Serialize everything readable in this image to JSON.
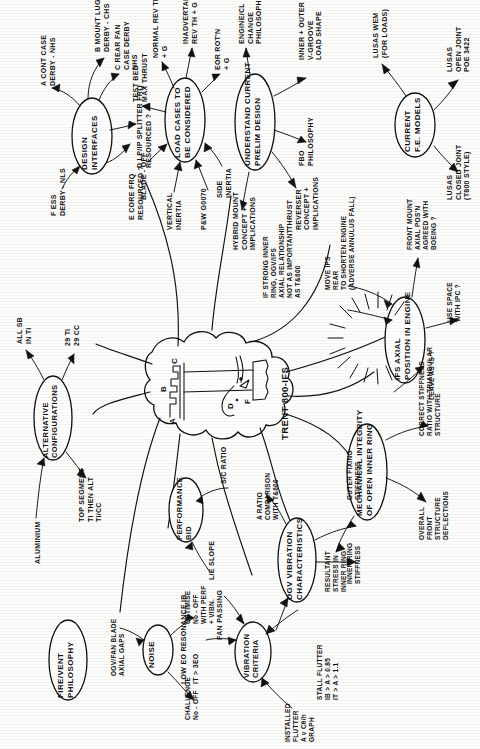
{
  "document": {
    "title": "TRENT 800-IFS Design Mind Map",
    "medium": "hand-drawn pencil sketch, scanned",
    "orientation": "text rotated 90 degrees (reads bottom-to-top)",
    "center_label": "TRENT 800-IFS",
    "center_sketch_labels": [
      "A",
      "B",
      "C",
      "D",
      "F"
    ]
  },
  "nodes": [
    {
      "id": "design-interfaces",
      "label": "DESIGN\nINTERFACES",
      "branches": [
        "A CONT CASE\nDERBY - NHS",
        "B MOUNT LUGS\nDERBY - CHS",
        "C REAR FAN\nCASE DERBY\nNHS",
        "D LP/IP SPLITTER FRQ\nRESOURCED ?",
        "E CORE FRQ\nRESOURCED ?",
        "F ESS\nDERBY - NLS"
      ]
    },
    {
      "id": "load-cases",
      "label": "LOAD CASES TO\nBE CONSIDERED",
      "branches": [
        "NORMAL REV TH\n+ G",
        "INADVERTANT\nREV TH + G",
        "EOR ROT'N\n+ G",
        "TEST BED\nMAX THRUST",
        "BLADE - OFF",
        "VERTICAL\nINERTIA",
        "P&W G0070",
        "SIDE\nINERTIA"
      ]
    },
    {
      "id": "understand-prelim",
      "label": "UNDERSTAND CURRENT\nPRELIM DESIGN",
      "branches": [
        "ENGINE/CL\nCHANGE\nPHILOSOPHY",
        "INNER + OUTER\nV-GROOVE\nLOAD SHAPE",
        "FBO\nPHILOSOPHY",
        "THRUST\nREVERSER\nCONCEPT +\nIMPLICATIONS",
        "HYBRID MOUNT\nCONCEPT +\nIMPLICATIONS"
      ]
    },
    {
      "id": "current-fe-models",
      "label": "CURRENT\nF.E. MODELS",
      "branches": [
        "LUSAS WEM\n(FOR LOADS)",
        "LUSAS\nOPEN JOINT\nPOE 3422",
        "LUSAS\nCLOSED JOINT\n(T800 STYLE)"
      ]
    },
    {
      "id": "ifs-axial-position",
      "label": "IFS AXIAL\nPOSITION IN ENGINE",
      "branches": [
        "IF STRONG INNER\nRING, OGV/IFS\nAXIAL RELATIONSHIP\nNOT AS IMPORTANT\nAS T&600",
        "MOVE IPS\nREAR\nTO SHORTEN ENGINE\n(ADVERSE ANNULUS FALL)",
        "FRONT MOUNT\nAXIAL POS'N\nAGREED WITH\nBOEING ?",
        "USE SPACE\nWITH IPC ?",
        "LEAVE AS IS ?"
      ]
    },
    {
      "id": "mechanical-integrity",
      "label": "MECHANICAL INTEGRITY\nOF OPEN INNER RING",
      "branches": [
        "CORRECT STIFFNESS\nRATIO WITH TRIANGULAR\nSTRUCTURE",
        "OVERALL\nFRONT\nSTRUCTURE\nDEFLECTIONS",
        "RESULTANT\nSTRESS IN\nINNER RING"
      ]
    },
    {
      "id": "ogv-vibration",
      "label": "OGV VIBRATION\nCHARACTERISTICS",
      "branches": [
        "OUTER FIXING\nSTIFFNESS",
        "INNER RING\nSTIFFNESS",
        "A RATIO\nCOMPARISON\nWITH T&600",
        "STALL FLUTTER\nIB > A > 0.85\nIT > A > 1.1"
      ]
    },
    {
      "id": "vibration-criteria",
      "label": "VIBRATION\nCRITERIA",
      "branches": [
        "LOW EO RESONANCE  IB",
        "IT > 3EO",
        "FAN PASSING",
        "INSTALLED\nFLUTTER\nA v Cθ/h\nGRAPH"
      ]
    },
    {
      "id": "noise",
      "label": "NOISE",
      "branches": [
        "OGV/FAN BLADE\nAXIAL GAPS",
        "OPTIMISE\nNo - OFF\nWITH PERF\n+ VIBN.",
        "CHALLENGE\nNo - OFF"
      ]
    },
    {
      "id": "performance-bid",
      "label": "PERFORMANCE\nBID",
      "branches": [
        "S/C RATIO",
        "L/E SLOPE"
      ]
    },
    {
      "id": "alternative-configurations",
      "label": "ALTERNATIVE\nCONFIGURATIONS",
      "branches": [
        "ALL SB\nIN Ti",
        "29 Ti\n29 CC",
        "TOP SEGMENT\nTi THEN ALT\nTi/CC",
        "ALUMINIUM"
      ]
    },
    {
      "id": "fire-vent-philosophy",
      "label": "FIRE/VENT\nPHILOSOPHY",
      "branches": []
    },
    {
      "id": "can-we-achieve",
      "label": "CAN WE ACHIEVE\nACCEPTANCE\nDESIGN WITH\nSHORT CHORD\nESS",
      "kind": "starburst",
      "branches": []
    }
  ]
}
